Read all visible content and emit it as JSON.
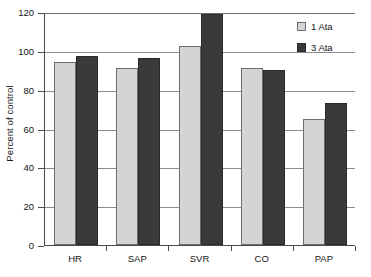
{
  "chart_data": {
    "type": "bar",
    "title": "",
    "xlabel": "",
    "ylabel": "Percent of control",
    "categories": [
      "HR",
      "SAP",
      "SVR",
      "CO",
      "PAP"
    ],
    "series": [
      {
        "name": "1 Ata",
        "color": "#d4d4d4",
        "values": [
          94.5,
          91,
          102.5,
          91,
          65
        ]
      },
      {
        "name": "3 Ata",
        "color": "#3a3a3a",
        "values": [
          97.5,
          96.5,
          119,
          90,
          73
        ]
      }
    ],
    "ylim": [
      0,
      120
    ],
    "ytick_step": 20,
    "yticks": [
      "0",
      "20",
      "40",
      "60",
      "80",
      "100",
      "120"
    ],
    "grid": "horizontal",
    "legend_position": "top-right"
  }
}
